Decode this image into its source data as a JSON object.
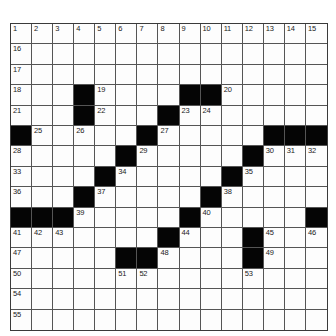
{
  "puzzle": {
    "rows": 15,
    "cols": 15,
    "colors": {
      "block": "#050505",
      "cell": "#fdfdfd",
      "line": "#555555"
    },
    "grid": [
      "...............",
      "...............",
      "...............",
      "...#....##.....",
      "...#...#.......",
      "#.....#.....###",
      ".....#.....#...",
      "....#.....#....",
      "...#.....#.....",
      "###.....#.....#",
      ".......#...#...",
      ".....##....#...",
      "...............",
      "...............",
      "..............."
    ],
    "numbers": [
      {
        "r": 0,
        "c": 0,
        "n": "1"
      },
      {
        "r": 0,
        "c": 1,
        "n": "2"
      },
      {
        "r": 0,
        "c": 2,
        "n": "3"
      },
      {
        "r": 0,
        "c": 3,
        "n": "4"
      },
      {
        "r": 0,
        "c": 4,
        "n": "5"
      },
      {
        "r": 0,
        "c": 5,
        "n": "6"
      },
      {
        "r": 0,
        "c": 6,
        "n": "7"
      },
      {
        "r": 0,
        "c": 7,
        "n": "8"
      },
      {
        "r": 0,
        "c": 8,
        "n": "9"
      },
      {
        "r": 0,
        "c": 9,
        "n": "10"
      },
      {
        "r": 0,
        "c": 10,
        "n": "11"
      },
      {
        "r": 0,
        "c": 11,
        "n": "12"
      },
      {
        "r": 0,
        "c": 12,
        "n": "13"
      },
      {
        "r": 0,
        "c": 13,
        "n": "14"
      },
      {
        "r": 0,
        "c": 14,
        "n": "15"
      },
      {
        "r": 1,
        "c": 0,
        "n": "16"
      },
      {
        "r": 2,
        "c": 0,
        "n": "17"
      },
      {
        "r": 3,
        "c": 0,
        "n": "18"
      },
      {
        "r": 3,
        "c": 4,
        "n": "19"
      },
      {
        "r": 3,
        "c": 10,
        "n": "20"
      },
      {
        "r": 4,
        "c": 0,
        "n": "21"
      },
      {
        "r": 4,
        "c": 4,
        "n": "22"
      },
      {
        "r": 4,
        "c": 8,
        "n": "23"
      },
      {
        "r": 4,
        "c": 9,
        "n": "24"
      },
      {
        "r": 5,
        "c": 1,
        "n": "25"
      },
      {
        "r": 5,
        "c": 3,
        "n": "26"
      },
      {
        "r": 5,
        "c": 7,
        "n": "27"
      },
      {
        "r": 6,
        "c": 0,
        "n": "28"
      },
      {
        "r": 6,
        "c": 6,
        "n": "29"
      },
      {
        "r": 6,
        "c": 12,
        "n": "30"
      },
      {
        "r": 6,
        "c": 13,
        "n": "31"
      },
      {
        "r": 6,
        "c": 14,
        "n": "32"
      },
      {
        "r": 7,
        "c": 0,
        "n": "33"
      },
      {
        "r": 7,
        "c": 5,
        "n": "34"
      },
      {
        "r": 7,
        "c": 11,
        "n": "35"
      },
      {
        "r": 8,
        "c": 0,
        "n": "36"
      },
      {
        "r": 8,
        "c": 4,
        "n": "37"
      },
      {
        "r": 8,
        "c": 10,
        "n": "38"
      },
      {
        "r": 9,
        "c": 3,
        "n": "39"
      },
      {
        "r": 9,
        "c": 9,
        "n": "40"
      },
      {
        "r": 10,
        "c": 0,
        "n": "41"
      },
      {
        "r": 10,
        "c": 1,
        "n": "42"
      },
      {
        "r": 10,
        "c": 2,
        "n": "43"
      },
      {
        "r": 10,
        "c": 8,
        "n": "44"
      },
      {
        "r": 10,
        "c": 12,
        "n": "45"
      },
      {
        "r": 10,
        "c": 14,
        "n": "46"
      },
      {
        "r": 11,
        "c": 0,
        "n": "47"
      },
      {
        "r": 11,
        "c": 7,
        "n": "48"
      },
      {
        "r": 11,
        "c": 12,
        "n": "49"
      },
      {
        "r": 12,
        "c": 0,
        "n": "50"
      },
      {
        "r": 12,
        "c": 5,
        "n": "51"
      },
      {
        "r": 12,
        "c": 6,
        "n": "52"
      },
      {
        "r": 12,
        "c": 11,
        "n": "53"
      },
      {
        "r": 13,
        "c": 0,
        "n": "54"
      },
      {
        "r": 14,
        "c": 0,
        "n": "55"
      }
    ]
  }
}
